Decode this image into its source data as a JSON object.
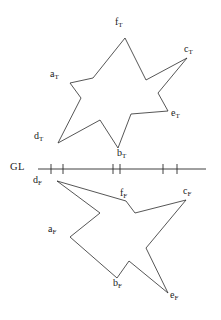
{
  "figure": {
    "canvas": {
      "width": 221,
      "height": 320,
      "background": "#ffffff"
    },
    "stroke_color": "#2b2b2b",
    "stroke_width": 0.8,
    "ground_line": {
      "label": "GL",
      "label_x": 10,
      "label_y": 162,
      "y": 169,
      "x_start": 38,
      "x_end": 206,
      "tick_half_height": 5,
      "ticks": [
        51,
        63,
        113,
        120,
        163,
        177
      ]
    },
    "top_star": {
      "name": "true-shape-star",
      "points": [
        {
          "id": "f_T",
          "letter": "f",
          "sub": "T",
          "x": 125,
          "y": 38,
          "label_x": 115,
          "label_y": 17,
          "notch_x": 0,
          "notch_y": 0
        },
        {
          "id": "c_T",
          "letter": "c",
          "sub": "T",
          "x": 187,
          "y": 58,
          "label_x": 184,
          "label_y": 44,
          "notch_x": 0,
          "notch_y": 0
        },
        {
          "id": "e_T",
          "letter": "e",
          "sub": "T",
          "x": 168,
          "y": 111,
          "label_x": 171,
          "label_y": 108,
          "notch_x": 0,
          "notch_y": 0
        },
        {
          "id": "b_T",
          "letter": "b",
          "sub": "T",
          "x": 118,
          "y": 148,
          "label_x": 117,
          "label_y": 148,
          "notch_x": 0,
          "notch_y": 0
        },
        {
          "id": "d_T",
          "letter": "d",
          "sub": "T",
          "x": 58,
          "y": 143,
          "label_x": 34,
          "label_y": 131,
          "notch_x": 0,
          "notch_y": 0
        },
        {
          "id": "a_T",
          "letter": "a",
          "sub": "T",
          "x": 70,
          "y": 83,
          "label_x": 50,
          "label_y": 69,
          "notch_x": 0,
          "notch_y": 0
        }
      ],
      "outline": "M 125,38 L 146,80 L 187,58 L 158,93 L 168,111 L 131,114 L 118,148 L 100,120 L 58,143 L 81,98 L 70,83 L 93,78 Z"
    },
    "bottom_star": {
      "name": "folded-shape-star",
      "points": [
        {
          "id": "d_F",
          "letter": "d",
          "sub": "F",
          "x": 57,
          "y": 181,
          "label_x": 33,
          "label_y": 175
        },
        {
          "id": "f_F",
          "letter": "f",
          "sub": "F",
          "x": 126,
          "y": 201,
          "label_x": 120,
          "label_y": 188
        },
        {
          "id": "c_F",
          "letter": "c",
          "sub": "F",
          "x": 186,
          "y": 200,
          "label_x": 183,
          "label_y": 186
        },
        {
          "id": "e_F",
          "letter": "e",
          "sub": "F",
          "x": 168,
          "y": 293,
          "label_x": 170,
          "label_y": 290
        },
        {
          "id": "b_F",
          "letter": "b",
          "sub": "F",
          "x": 117,
          "y": 278,
          "label_x": 113,
          "label_y": 278
        },
        {
          "id": "a_F",
          "letter": "a",
          "sub": "F",
          "x": 70,
          "y": 237,
          "label_x": 48,
          "label_y": 224
        }
      ],
      "outline": "M 57,181 L 126,201 L 135,213 L 186,200 L 146,248 L 168,293 L 129,261 L 117,278 L 70,237 L 100,213 L 57,181 Z"
    }
  }
}
